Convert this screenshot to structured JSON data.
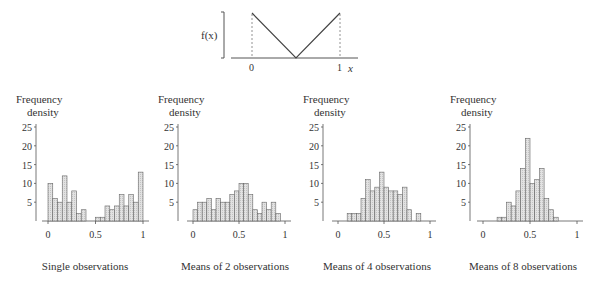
{
  "top_figure": {
    "ylabel": "f(x)",
    "xlabel": "x",
    "ticks": [
      "0",
      "1"
    ],
    "description": "V-shaped density: f(x) decreases linearly from 0 to 0.5 then increases to 1"
  },
  "chart_data": [
    {
      "type": "bar",
      "title": "Single observations",
      "ylabel": "Frequency density",
      "xlabel": "",
      "ylim": [
        0,
        25
      ],
      "yticks": [
        "5",
        "10",
        "15",
        "20",
        "25"
      ],
      "xticks": [
        "0",
        "0.5",
        "1"
      ],
      "bin_width": 0.05,
      "bins_start": [
        0.0,
        0.05,
        0.1,
        0.15,
        0.2,
        0.25,
        0.3,
        0.35,
        0.4,
        0.45,
        0.5,
        0.55,
        0.6,
        0.65,
        0.7,
        0.75,
        0.8,
        0.85,
        0.9,
        0.95
      ],
      "values": [
        10,
        6,
        5,
        12,
        5,
        8,
        2,
        3,
        0,
        0,
        1,
        1,
        4,
        3,
        4,
        7,
        4,
        7,
        5,
        13
      ]
    },
    {
      "type": "bar",
      "title": "Means of 2 observations",
      "ylabel": "Frequency density",
      "xlabel": "",
      "ylim": [
        0,
        25
      ],
      "yticks": [
        "5",
        "10",
        "15",
        "20",
        "25"
      ],
      "xticks": [
        "0",
        "0.5",
        "1"
      ],
      "bin_width": 0.05,
      "bins_start": [
        0.0,
        0.05,
        0.1,
        0.15,
        0.2,
        0.25,
        0.3,
        0.35,
        0.4,
        0.45,
        0.5,
        0.55,
        0.6,
        0.65,
        0.7,
        0.75,
        0.8,
        0.85,
        0.9
      ],
      "values": [
        3,
        5,
        5,
        6,
        3,
        6,
        5,
        5,
        7,
        8,
        10,
        10,
        7,
        3,
        2,
        5,
        3,
        5,
        2
      ]
    },
    {
      "type": "bar",
      "title": "Means of 4 observations",
      "ylabel": "Frequency density",
      "xlabel": "",
      "ylim": [
        0,
        25
      ],
      "yticks": [
        "5",
        "10",
        "15",
        "20",
        "25"
      ],
      "xticks": [
        "0",
        "0.5",
        "1"
      ],
      "bin_width": 0.05,
      "bins_start": [
        0.1,
        0.15,
        0.2,
        0.25,
        0.3,
        0.35,
        0.4,
        0.45,
        0.5,
        0.55,
        0.6,
        0.65,
        0.7,
        0.75,
        0.8,
        0.85
      ],
      "values": [
        2,
        2,
        2,
        6,
        11,
        8,
        9,
        13,
        9,
        8,
        8,
        7,
        9,
        3,
        0,
        2
      ]
    },
    {
      "type": "bar",
      "title": "Means of 8 observations",
      "ylabel": "Frequency density",
      "xlabel": "",
      "ylim": [
        0,
        25
      ],
      "yticks": [
        "5",
        "10",
        "15",
        "20",
        "25"
      ],
      "xticks": [
        "0",
        "0.5",
        "1"
      ],
      "bin_width": 0.05,
      "bins_start": [
        0.15,
        0.2,
        0.25,
        0.3,
        0.35,
        0.4,
        0.45,
        0.5,
        0.55,
        0.6,
        0.65,
        0.7,
        0.75
      ],
      "values": [
        1,
        1,
        5,
        4,
        8,
        14,
        22,
        10,
        11,
        14,
        6,
        3,
        1
      ]
    }
  ],
  "panels": [
    {
      "title": "Single observations",
      "ylabel_line1": "Frequency",
      "ylabel_line2": "density"
    },
    {
      "title": "Means of 2 observations",
      "ylabel_line1": "Frequency",
      "ylabel_line2": "density"
    },
    {
      "title": "Means of 4 observations",
      "ylabel_line1": "Frequency",
      "ylabel_line2": "density"
    },
    {
      "title": "Means of 8 observations",
      "ylabel_line1": "Frequency",
      "ylabel_line2": "density"
    }
  ],
  "colors": {
    "bar_fill": "#d9d9d9",
    "bar_stroke": "#666666",
    "axis": "#555555",
    "text": "#333333"
  }
}
